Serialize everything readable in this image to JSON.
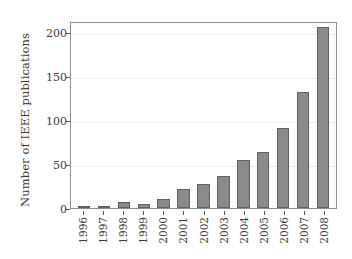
{
  "chart_data": {
    "type": "bar",
    "title": "",
    "xlabel": "",
    "ylabel": "Number of IEEE publications",
    "categories": [
      "1996",
      "1997",
      "1998",
      "1999",
      "2000",
      "2001",
      "2002",
      "2003",
      "2004",
      "2005",
      "2006",
      "2007",
      "2008"
    ],
    "values": [
      2,
      1,
      7,
      5,
      10,
      22,
      27,
      36,
      54,
      63,
      91,
      131,
      205
    ],
    "series": [
      {
        "name": "Number of IEEE publications",
        "values": [
          2,
          1,
          7,
          5,
          10,
          22,
          27,
          36,
          54,
          63,
          91,
          131,
          205
        ]
      }
    ],
    "ylim": [
      0,
      212
    ],
    "yticks": [
      0,
      50,
      100,
      150,
      200
    ],
    "ytick_labels": [
      "0",
      "50",
      "100",
      "150",
      "200"
    ],
    "grid": "horizontal",
    "legend": "none",
    "bar_color": "#8b8b8b",
    "bar_edge_color": "#606060",
    "grid_color": "#ededed",
    "frame_color": "#8e8e8e",
    "text_color": "#3b3b3b"
  }
}
